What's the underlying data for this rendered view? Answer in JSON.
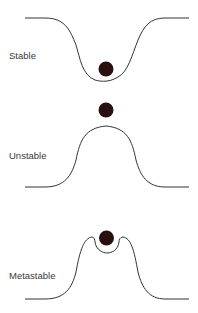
{
  "diagram": {
    "panels": [
      {
        "label": "Stable",
        "shape": "valley",
        "ball": "bottom-of-valley"
      },
      {
        "label": "Unstable",
        "shape": "hill",
        "ball": "top-of-hill"
      },
      {
        "label": "Metastable",
        "shape": "hill-with-dip",
        "ball": "in-dip-on-hilltop"
      }
    ],
    "colors": {
      "line": "#333333",
      "ball": "#2a0f0f",
      "text": "#3a3a3a"
    }
  }
}
